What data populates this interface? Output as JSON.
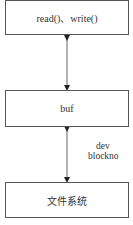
{
  "diagram": {
    "nodes": [
      {
        "id": "top",
        "label": "read()、write()"
      },
      {
        "id": "middle",
        "label": "buf"
      },
      {
        "id": "bottom",
        "label": "文件系统"
      }
    ],
    "edges": [
      {
        "from": "top",
        "to": "middle",
        "direction": "bidirectional",
        "label": ""
      },
      {
        "from": "middle",
        "to": "bottom",
        "direction": "bidirectional",
        "label_lines": [
          "dev",
          "blockno"
        ]
      }
    ]
  }
}
